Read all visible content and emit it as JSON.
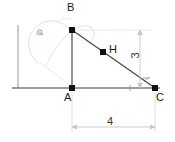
{
  "figure": {
    "type": "geometry-diagram",
    "background": "#ffffff",
    "stroke_color": "#3b3b3b",
    "construction_color": "#c9c9c9",
    "dimension_color": "#b0b0b0"
  },
  "points": [
    {
      "id": "A",
      "label": "A",
      "x": 72,
      "y": 88,
      "marker": "square-dot"
    },
    {
      "id": "B",
      "label": "B",
      "x": 72,
      "y": 30,
      "marker": "square-dot"
    },
    {
      "id": "C",
      "label": "C",
      "x": 155,
      "y": 88,
      "marker": "square-dot"
    },
    {
      "id": "H",
      "label": "H",
      "x": 103,
      "y": 52,
      "marker": "square-dot"
    }
  ],
  "labels": {
    "point_a": "A",
    "point_b": "B",
    "point_c": "C",
    "point_h": "H",
    "angle_phi": "φ",
    "dim_vertical": "3",
    "dim_horizontal": "4"
  },
  "dimensions": [
    {
      "name": "vertical-dimension",
      "value": "3",
      "orientation": "vertical",
      "from_y": 30,
      "to_y": 88,
      "at_x": 140
    },
    {
      "name": "horizontal-dimension",
      "value": "4",
      "orientation": "horizontal",
      "from_x": 72,
      "to_x": 155,
      "at_y": 125
    }
  ],
  "segments": [
    {
      "name": "baseline",
      "from": [
        12,
        88
      ],
      "to": [
        160,
        88
      ]
    },
    {
      "name": "leg-AB",
      "from": [
        72,
        88
      ],
      "to": [
        72,
        30
      ]
    },
    {
      "name": "hypotenuse-BC",
      "from": [
        72,
        30
      ],
      "to": [
        155,
        88
      ]
    },
    {
      "name": "left-axis",
      "from": [
        18,
        25
      ],
      "to": [
        18,
        88
      ]
    }
  ],
  "annotations": {
    "right_angle_at": "C",
    "angle_arc_at": "B",
    "angle_arc_label": "φ"
  }
}
